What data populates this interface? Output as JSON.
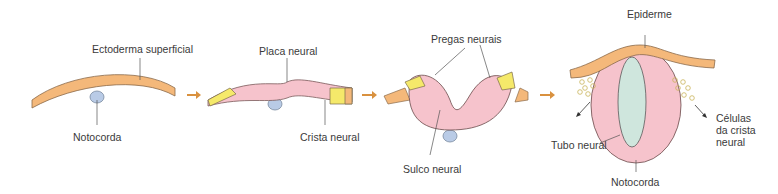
{
  "stages": [
    {
      "id": 1,
      "labels": {
        "top": "Ectoderma superficial",
        "bottom": "Notocorda"
      }
    },
    {
      "id": 2,
      "labels": {
        "top": "Placa neural",
        "bottom": "Crista neural"
      }
    },
    {
      "id": 3,
      "labels": {
        "top": "Pregas neurais",
        "bottom": "Sulco neural"
      }
    },
    {
      "id": 4,
      "labels": {
        "top": "Epiderme",
        "left": "Tubo neural",
        "right_1": "Células",
        "right_2": "da crista",
        "right_3": "neural",
        "bottom": "Notocorda"
      }
    }
  ],
  "colors": {
    "ectoderm": "#f4b87a",
    "neural": "#f6c3cc",
    "crest": "#f5e96a",
    "notochord": "#b9cbe6",
    "lumen": "#cfe6dd",
    "arrow": "#d9913f",
    "outline": "#5a4a40"
  }
}
